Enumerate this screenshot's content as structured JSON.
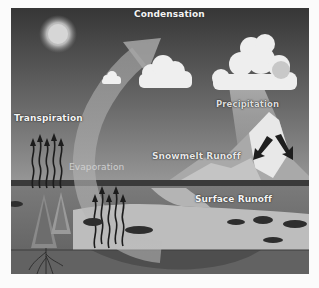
{
  "diagram": {
    "labels": {
      "condensation": "Condensation",
      "precipitation": "Precipitation",
      "transpiration": "Transpiration",
      "evaporation": "Evaporation",
      "snowmelt_runoff": "Snowmelt Runoff",
      "surface_runoff": "Surface Runoff"
    },
    "elements": [
      "sun",
      "small-cloud",
      "medium-cloud",
      "rain-cloud",
      "mountain",
      "trees",
      "lake",
      "roots",
      "evaporation-arrow"
    ],
    "colors": {
      "sky_top": "#3a3a3a",
      "sky_bottom": "#8c8c8c",
      "ground": "#6e6e6e",
      "water": "#c9c9c9",
      "label_text": "#f4f4f4"
    }
  }
}
